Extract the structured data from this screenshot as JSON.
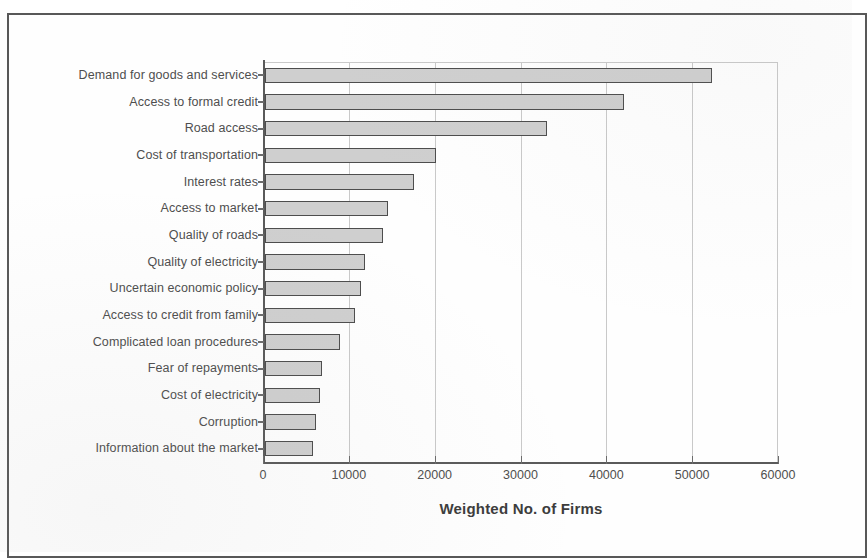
{
  "figure": {
    "axis_title": "Weighted No. of Firms"
  },
  "chart_data": {
    "type": "bar",
    "orientation": "horizontal",
    "title": "",
    "xlabel": "Weighted No. of Firms",
    "ylabel": "",
    "xlim": [
      0,
      60000
    ],
    "xticks": [
      "0",
      "10000",
      "20000",
      "30000",
      "40000",
      "50000",
      "60000"
    ],
    "xtick_values": [
      0,
      10000,
      20000,
      30000,
      40000,
      50000,
      60000
    ],
    "grid": "vertical",
    "legend": "none",
    "bar_fill_color": "#cfcfcf",
    "bar_edge_color": "#4d4d4d",
    "categories": [
      "Demand for goods and services",
      "Access to formal credit",
      "Road access",
      "Cost of transportation",
      "Interest rates",
      "Access to market",
      "Quality of roads",
      "Quality of electricity",
      "Uncertain economic policy",
      "Access to credit from family",
      "Complicated loan procedures",
      "Fear of repayments",
      "Cost of electricity",
      "Corruption",
      "Information about the market"
    ],
    "values": [
      52100,
      41800,
      32900,
      19900,
      17400,
      14300,
      13800,
      11600,
      11200,
      10500,
      8700,
      6600,
      6400,
      5900,
      5600
    ]
  }
}
